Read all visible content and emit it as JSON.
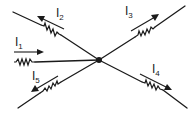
{
  "diagram": {
    "type": "kirchhoff-current-law-node",
    "node": {
      "x": 99,
      "y": 60,
      "label": ""
    },
    "colors": {
      "stroke": "#1a1a1a",
      "background": "#ffffff"
    },
    "branches": [
      {
        "id": "I1",
        "label_main": "I",
        "label_sub": "1",
        "direction": "into-node",
        "from": "left"
      },
      {
        "id": "I2",
        "label_main": "I",
        "label_sub": "2",
        "direction": "out-of-node",
        "to": "upper-left"
      },
      {
        "id": "I3",
        "label_main": "I",
        "label_sub": "3",
        "direction": "out-of-node",
        "to": "upper-right"
      },
      {
        "id": "I4",
        "label_main": "I",
        "label_sub": "4",
        "direction": "out-of-node",
        "to": "lower-right"
      },
      {
        "id": "I5",
        "label_main": "I",
        "label_sub": "5",
        "direction": "out-of-node",
        "to": "lower-left"
      }
    ]
  }
}
